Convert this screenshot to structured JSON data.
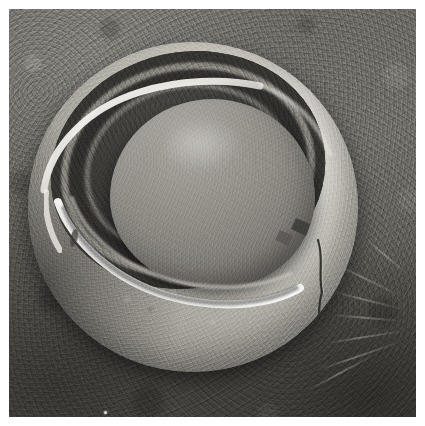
{
  "image": {
    "kind": "scanning-electron-micrograph",
    "modality": "SEM",
    "color_mode": "grayscale",
    "caption_text": "",
    "width_px": 425,
    "height_px": 426
  },
  "plate": {
    "border_color": "#ffffff",
    "border_width_px": 9,
    "inner_width_px": 407,
    "inner_height_px": 408
  },
  "palette": {
    "border_white": "#ffffff",
    "background_light": "#6e6c67",
    "background_mid": "#5a5852",
    "background_dark": "#3b3a36",
    "shell_highlight": "#e2dfd7",
    "shell_midtone": "#bab7af",
    "shell_shadow": "#7e7c76",
    "cavity_dark": "#343230",
    "cavity_darkest": "#2a2926",
    "inner_sphere_light": "#a9a6a0",
    "inner_sphere_mid": "#8e8b85",
    "inner_sphere_shadow": "#6e6b66",
    "rim_white": "#f3f1ec",
    "crack_dark": "#26251f"
  },
  "subject": {
    "label": "sectioned spherical specimen",
    "outer_shell": {
      "name": "outer-shell",
      "center_px": [
        193,
        207
      ],
      "radius_px": 165,
      "surface": "fine granular, light gray",
      "description": "Spherical outer wall cut open on the upper-left to form a bowl."
    },
    "cut_cavity": {
      "name": "cut-cavity",
      "center_px": [
        160,
        128
      ],
      "semi_major_px": 138,
      "semi_minor_px": 118,
      "rotation_deg": -12,
      "description": "Elliptical opening revealing the interior, dark and recessed."
    },
    "cut_rim": {
      "name": "cut-rim",
      "description": "Bright white crest along the fractured edge, sweeping from upper-left down through the center.",
      "brightness": "specular white"
    },
    "coat_layers": {
      "name": "concentric-coat-layers",
      "count": 4,
      "location": "upper-right of the cavity",
      "description": "Alternating dark grooves and lighter ridges forming concentric bands."
    },
    "inner_sphere": {
      "name": "inner-sphere",
      "center_px": [
        185,
        152
      ],
      "radius_x_px": 103,
      "radius_y_px": 95,
      "surface": "smooth, featureless medium gray",
      "highlight": "upper-left diffuse specular"
    },
    "crack": {
      "name": "shell-crack",
      "start_px": [
        318,
        240
      ],
      "end_px": [
        309,
        352
      ],
      "description": "Thin dark fissure descending the right flank of the shell."
    },
    "fibers": {
      "name": "substrate-fibers",
      "count": 7,
      "location": "lower-right background",
      "description": "Faint light filaments radiating across the substrate."
    },
    "speck": {
      "name": "dust-speck",
      "position_px": [
        105,
        412
      ],
      "size_px": 3,
      "description": "Small bright particle on the substrate near the bottom edge."
    }
  },
  "annotations": {
    "scale_bar": null,
    "magnification": null,
    "instrument_banner": null,
    "visible_text": []
  }
}
